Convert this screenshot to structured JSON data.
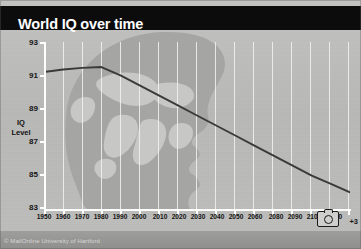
{
  "banner": {
    "title": "World IQ over time"
  },
  "watermark": {
    "text": "© MailOnline University of Hartford"
  },
  "overlay": {
    "camera_icon": "camera-icon",
    "photo_count": "+3"
  },
  "chart_data": {
    "type": "line",
    "title": "World IQ over time",
    "xlabel": "",
    "ylabel": "IQ Level",
    "ylabel_line1": "IQ",
    "ylabel_line2": "Level",
    "ylim": [
      83,
      93
    ],
    "xlim": [
      1950,
      2110
    ],
    "grid": true,
    "legend": false,
    "yticks": [
      93,
      91,
      89,
      87,
      85,
      83
    ],
    "xticks": [
      "1950",
      "1960",
      "1970",
      "1980",
      "1990",
      "2000",
      "2010",
      "2020",
      "2030",
      "2040",
      "2050",
      "2060",
      "2080",
      "2090",
      "2100",
      "2110"
    ],
    "x": [
      1950,
      1960,
      1970,
      1980,
      1990,
      2000,
      2010,
      2020,
      2030,
      2040,
      2050,
      2060,
      2070,
      2080,
      2090,
      2100,
      2110
    ],
    "values": [
      91.2,
      91.35,
      91.45,
      91.5,
      91.0,
      90.4,
      89.8,
      89.2,
      88.6,
      88.0,
      87.4,
      86.8,
      86.2,
      85.6,
      85.0,
      84.5,
      84.0
    ],
    "series": [
      {
        "name": "World IQ",
        "color": "#3a3a3a",
        "values": [
          91.2,
          91.35,
          91.45,
          91.5,
          91.0,
          90.4,
          89.8,
          89.2,
          88.6,
          88.0,
          87.4,
          86.8,
          86.2,
          85.6,
          85.0,
          84.5,
          84.0
        ]
      }
    ],
    "background_image": "human-head-silhouette-with-world-map"
  },
  "colors": {
    "banner_bg": "#0c0c0c",
    "banner_text": "#ffffff",
    "chart_bg": "#bdbdbb",
    "gridline": "#f2f2f0",
    "axis": "#ffffff",
    "line": "#3a3a3a",
    "head_fill": "#a3a3a1"
  }
}
